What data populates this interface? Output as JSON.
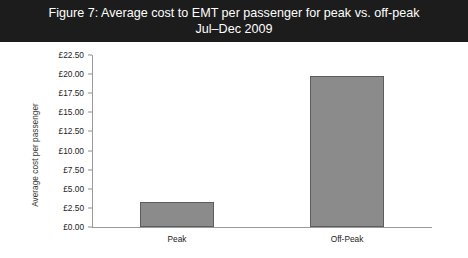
{
  "figure": {
    "title_line1": "Figure 7: Average cost to EMT per passenger for peak vs. off-peak",
    "title_line2": "Jul–Dec 2009",
    "title_bg": "#1c1c1c",
    "title_color": "#ffffff"
  },
  "chart_data": {
    "type": "bar",
    "title": "Figure 7: Average cost to EMT per passenger for peak vs. off-peak Jul–Dec 2009",
    "categories": [
      "Peak",
      "Off-Peak"
    ],
    "values": [
      3.3,
      19.8
    ],
    "xlabel": "",
    "ylabel": "Average cost per passenger",
    "ylim": [
      0,
      22.5
    ],
    "ytick_step": 2.5,
    "ytick_labels": [
      "£22.50",
      "£20.00",
      "£17.50",
      "£15.00",
      "£12.50",
      "£10.00",
      "£7.50",
      "£5.00",
      "£2.50",
      "£0.00"
    ],
    "ytick_values": [
      22.5,
      20.0,
      17.5,
      15.0,
      12.5,
      10.0,
      7.5,
      5.0,
      2.5,
      0.0
    ],
    "grid": false,
    "legend": null,
    "bar_color": "#8b8b8b",
    "bar_edge_color": "#5d5d5d",
    "axis_color": "#9a9a9a",
    "plot_background": "#ffffff"
  }
}
